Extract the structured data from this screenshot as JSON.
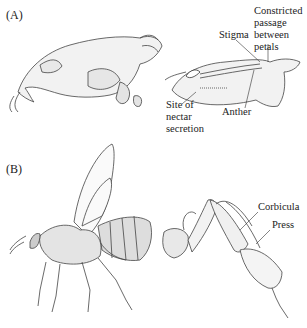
{
  "panels": [
    {
      "id": "A",
      "label": "(A)",
      "illustrations": [
        "flower-side-view",
        "flower-cross-section"
      ],
      "annotations": {
        "stigma": "Stigma",
        "constricted_1": "Constricted",
        "constricted_2": "passage",
        "constricted_3": "between",
        "constricted_4": "petals",
        "site_1": "Site of",
        "site_2": "nectar",
        "site_3": "secretion",
        "anther": "Anther"
      }
    },
    {
      "id": "B",
      "label": "(B)",
      "illustrations": [
        "honeybee-side-view",
        "bee-hind-leg"
      ],
      "annotations": {
        "corbicula": "Corbicula",
        "press": "Press"
      }
    }
  ]
}
